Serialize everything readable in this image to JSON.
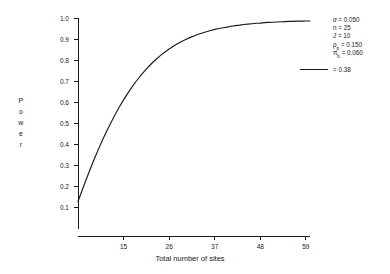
{
  "chart_data": {
    "type": "line",
    "title": "",
    "xlabel": "Total number of sites",
    "ylabel": "Power",
    "xlim": [
      4,
      60
    ],
    "ylim": [
      0.0,
      1.0
    ],
    "grid": false,
    "legend_position": "right",
    "xticks": [
      15,
      26,
      37,
      48,
      59
    ],
    "yticks": [
      "0.1",
      "0.2",
      "0.3",
      "0.4",
      "0.5",
      "0.6",
      "0.7",
      "0.8",
      "0.9",
      "1.0"
    ],
    "ytick_values": [
      0.1,
      0.2,
      0.3,
      0.4,
      0.5,
      0.6,
      0.7,
      0.8,
      0.9,
      1.0
    ],
    "series": [
      {
        "name": "= 0.38",
        "color": "#1a1a1a",
        "x": [
          4,
          5,
          6,
          7,
          8,
          9,
          10,
          11,
          12,
          13,
          14,
          15,
          16,
          17,
          18,
          19,
          20,
          21,
          22,
          23,
          24,
          25,
          26,
          27,
          28,
          29,
          30,
          31,
          32,
          33,
          34,
          35,
          36,
          37,
          38,
          39,
          40,
          41,
          42,
          43,
          44,
          45,
          46,
          47,
          48,
          49,
          50,
          51,
          52,
          53,
          54,
          55,
          56,
          57,
          58,
          59,
          60
        ],
        "y": [
          0.13,
          0.184,
          0.236,
          0.287,
          0.335,
          0.381,
          0.425,
          0.467,
          0.506,
          0.544,
          0.579,
          0.612,
          0.643,
          0.672,
          0.699,
          0.724,
          0.747,
          0.769,
          0.789,
          0.807,
          0.824,
          0.839,
          0.853,
          0.866,
          0.878,
          0.889,
          0.898,
          0.907,
          0.915,
          0.923,
          0.929,
          0.935,
          0.941,
          0.946,
          0.95,
          0.954,
          0.957,
          0.961,
          0.964,
          0.966,
          0.969,
          0.971,
          0.973,
          0.975,
          0.976,
          0.978,
          0.979,
          0.98,
          0.981,
          0.982,
          0.983,
          0.984,
          0.984,
          0.985,
          0.985,
          0.986,
          0.986
        ]
      }
    ],
    "annotations": [
      {
        "label": "α = 0.050"
      },
      {
        "label": "n = 25"
      },
      {
        "label": "J = 10"
      },
      {
        "label": "ρ = 0.150",
        "subscript": "p"
      },
      {
        "label": "π = 0.060",
        "subscript": "b"
      }
    ]
  },
  "legend": {
    "alpha_symbol": "α",
    "alpha_text": " = 0.050",
    "n_text": "n = 25",
    "j_symbol": "J",
    "j_text": " = 10",
    "rho_symbol": "ρ",
    "rho_sub": "p",
    "rho_text": " = 0.150",
    "pi_symbol": "π",
    "pi_sub": "b",
    "pi_text": " = 0.060",
    "entry_label": "= 0.38"
  },
  "axes": {
    "ylabel_letters": [
      "P",
      "o",
      "w",
      "e",
      "r"
    ],
    "xlabel": "Total number of sites"
  }
}
